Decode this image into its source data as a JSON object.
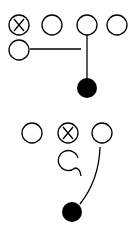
{
  "diagram": {
    "colors": {
      "stroke": "#000000",
      "fill": "#000000",
      "background": "#ffffff"
    },
    "top_play": {
      "players": [
        {
          "id": "x1",
          "cx": 19,
          "cy": 25,
          "marked": true
        },
        {
          "id": "o1",
          "cx": 52,
          "cy": 25,
          "marked": false
        },
        {
          "id": "o2",
          "cx": 87,
          "cy": 25,
          "marked": false
        },
        {
          "id": "o3",
          "cx": 117,
          "cy": 25,
          "marked": false
        },
        {
          "id": "o4",
          "cx": 19,
          "cy": 50,
          "marked": false
        }
      ],
      "ball_carrier": {
        "cx": 87,
        "cy": 88
      },
      "routes": [
        "horizontal line from left player",
        "vertical line down to filled circle"
      ]
    },
    "bottom_play": {
      "players": [
        {
          "id": "o5",
          "cx": 32,
          "cy": 133,
          "marked": false
        },
        {
          "id": "x2",
          "cx": 68,
          "cy": 133,
          "marked": true
        },
        {
          "id": "o6",
          "cx": 102,
          "cy": 133,
          "marked": false
        },
        {
          "id": "o7",
          "cx": 69,
          "cy": 161,
          "marked": false
        }
      ],
      "ball_carrier": {
        "cx": 72,
        "cy": 212
      },
      "routes": [
        "curl tail from lower player",
        "curved line down to filled circle"
      ]
    }
  }
}
